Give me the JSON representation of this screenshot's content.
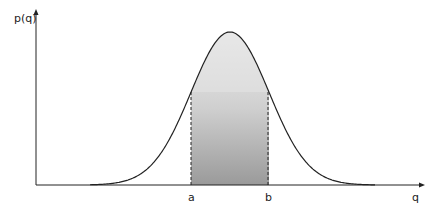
{
  "diagram": {
    "y_axis_label": "p(q)",
    "x_axis_label": "q",
    "interval_lower_label": "a",
    "interval_upper_label": "b"
  },
  "chart_data": {
    "type": "area",
    "title": "",
    "xlabel": "q",
    "ylabel": "p(q)",
    "curve": "gaussian",
    "shaded_region": {
      "from": "a",
      "to": "b"
    },
    "annotations": [
      "a",
      "b"
    ]
  },
  "colors": {
    "curve": "#222222",
    "axis": "#222222",
    "shade_dark": "#9a9a9a",
    "shade_light": "#efefef"
  }
}
